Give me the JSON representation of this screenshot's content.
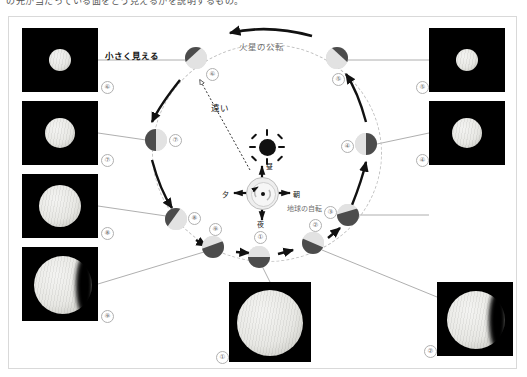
{
  "page": {
    "top_caption": "の光が当たっている面をどう見えるかを説明するもの。",
    "title_alt": "火星の見かけの大きさと満ち欠け"
  },
  "labels": {
    "mars_revolution": "火星の公転",
    "earth_rotation": "地球の自転",
    "looks_small": "小さく見える",
    "far": "遠い",
    "noon": "昼",
    "morning": "朝",
    "evening": "夕",
    "night": "夜"
  },
  "colors": {
    "background": "#ffffff",
    "frame_border": "#d9d9d9",
    "orbit_dash": "#c2c2c2",
    "photo_bg": "#000000",
    "mars_lit": "#e2e2e2",
    "mars_dark": "#4c4c4c",
    "leader_line": "#9a9a9a",
    "text": "#111111",
    "sun": "#111111"
  },
  "orbit_positions": [
    {
      "id": "p1",
      "number": "①",
      "x": 259,
      "y": 257,
      "size": 22,
      "dark_side": "bottom",
      "tag_dx": -3,
      "tag_dy": -17
    },
    {
      "id": "p2",
      "number": "②",
      "x": 313,
      "y": 243,
      "size": 22,
      "dark_side": "bottomleft",
      "tag_dx": -2,
      "tag_dy": -16
    },
    {
      "id": "p3",
      "number": "③",
      "x": 348,
      "y": 215,
      "size": 22,
      "dark_side": "bottomleft",
      "tag_dx": -15,
      "tag_dy": -2
    },
    {
      "id": "p4",
      "number": "④",
      "x": 366,
      "y": 144,
      "size": 22,
      "dark_side": "right",
      "tag_dx": -16,
      "tag_dy": 3
    },
    {
      "id": "p5",
      "number": "⑤",
      "x": 337,
      "y": 58,
      "size": 22,
      "dark_side": "topright",
      "tag_dx": -3,
      "tag_dy": 18
    },
    {
      "id": "p6",
      "number": "⑥",
      "x": 196,
      "y": 58,
      "size": 22,
      "dark_side": "topleft",
      "tag_dx": 19,
      "tag_dy": 14
    },
    {
      "id": "p7",
      "number": "⑦",
      "x": 156,
      "y": 140,
      "size": 22,
      "dark_side": "left",
      "tag_dx": 20,
      "tag_dy": 2
    },
    {
      "id": "p8",
      "number": "⑧",
      "x": 176,
      "y": 219,
      "size": 22,
      "dark_side": "topleft",
      "tag_dx": 20,
      "tag_dy": 2
    },
    {
      "id": "p9",
      "number": "⑨",
      "x": 213,
      "y": 247,
      "size": 22,
      "dark_side": "bottomright",
      "tag_dx": -2,
      "tag_dy": -17
    }
  ],
  "photos": [
    {
      "id": "ph6",
      "number": "⑥",
      "x": 22,
      "y": 28,
      "w": 76,
      "h": 64,
      "disc": 22,
      "phase": "full"
    },
    {
      "id": "ph7",
      "number": "⑦",
      "x": 22,
      "y": 101,
      "w": 76,
      "h": 64,
      "disc": 30,
      "phase": "full"
    },
    {
      "id": "ph8",
      "number": "⑧",
      "x": 22,
      "y": 174,
      "w": 76,
      "h": 64,
      "disc": 42,
      "phase": "full"
    },
    {
      "id": "ph9",
      "number": "⑨",
      "x": 22,
      "y": 247,
      "w": 76,
      "h": 74,
      "disc": 58,
      "phase": "gibbous"
    },
    {
      "id": "ph1",
      "number": "①",
      "x": 229,
      "y": 282,
      "w": 82,
      "h": 80,
      "disc": 66,
      "phase": "full"
    },
    {
      "id": "ph2",
      "number": "②",
      "x": 437,
      "y": 282,
      "w": 76,
      "h": 74,
      "disc": 58,
      "phase": "gibbous"
    },
    {
      "id": "ph4",
      "number": "④",
      "x": 429,
      "y": 101,
      "w": 76,
      "h": 64,
      "disc": 30,
      "phase": "full"
    },
    {
      "id": "ph5",
      "number": "⑤",
      "x": 429,
      "y": 28,
      "w": 76,
      "h": 64,
      "disc": 22,
      "phase": "full"
    }
  ],
  "earth": {
    "center_x": 262,
    "center_y": 192,
    "rotation_label": "地球の自転"
  },
  "sun": {
    "center_x": 267,
    "center_y": 147
  }
}
